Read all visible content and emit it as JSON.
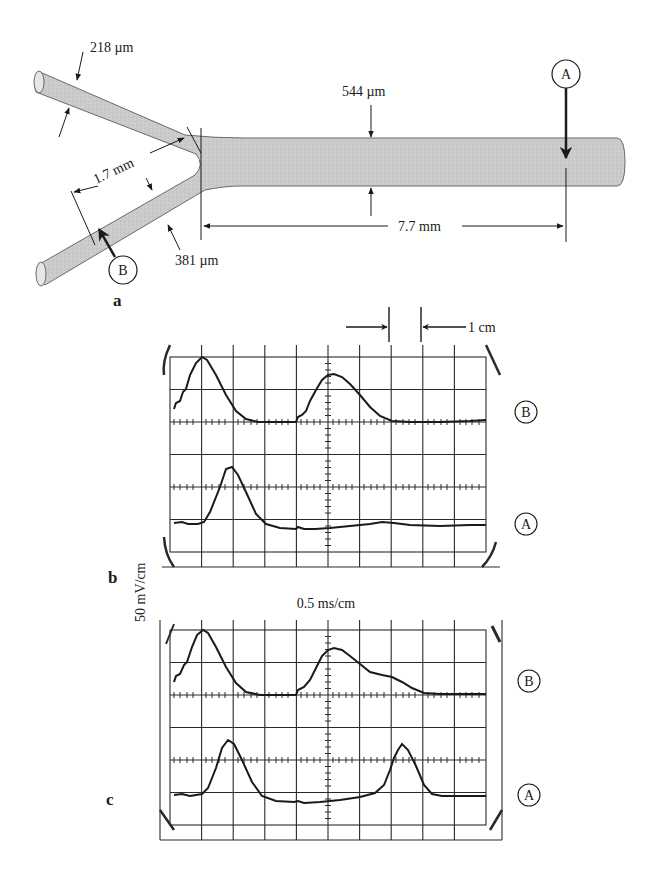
{
  "figure": {
    "panel_a": {
      "label": "a",
      "dimensions": {
        "upper_branch_diameter": "218 µm",
        "lower_branch_diameter": "381 µm",
        "trunk_diameter": "544 µm",
        "branch_distance": "1.7 mm",
        "trunk_distance": "7.7 mm"
      },
      "recording_sites": {
        "A": "A",
        "B": "B"
      }
    },
    "scale": {
      "horizontal": "0.5 ms/cm",
      "vertical": "50 mV/cm",
      "grid_marker": "1 cm"
    },
    "panel_b": {
      "label": "b",
      "trace_labels": [
        "B",
        "A"
      ]
    },
    "panel_c": {
      "label": "c",
      "trace_labels": [
        "B",
        "A"
      ]
    }
  },
  "colors": {
    "tube_fill": "#c8c8c8",
    "ink": "#1a1a1a",
    "background": "#ffffff"
  }
}
